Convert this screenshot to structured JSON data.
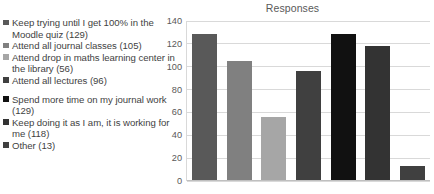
{
  "chart_data": {
    "type": "bar",
    "title": "Responses",
    "xlabel": "",
    "ylabel": "",
    "ylim": [
      0,
      140
    ],
    "ytick_step": 20,
    "yticks": [
      140,
      120,
      100,
      80,
      60,
      40,
      20,
      0
    ],
    "grid": true,
    "legend_position": "left",
    "categories": [
      "Keep trying until I get 100% in the Moodle quiz  (129)",
      "Attend all journal classes  (105)",
      "Attend drop in maths learning center in the library  (56)",
      "Attend all lectures  (96)",
      "Spend more time on my journal work  (129)",
      "Keep doing it as I am, it is working for me  (118)",
      "Other (13)"
    ],
    "values": [
      129,
      105,
      56,
      96,
      129,
      118,
      13
    ],
    "colors": [
      "#595959",
      "#808080",
      "#a6a6a6",
      "#404040",
      "#111111",
      "#333333",
      "#404040"
    ]
  },
  "legend": {
    "items": [
      {
        "label": "Keep trying until I get 100% in the Moodle quiz  (129)",
        "color": "#595959"
      },
      {
        "label": "Attend all journal classes  (105)",
        "color": "#808080"
      },
      {
        "label": "Attend drop in maths learning center in the library  (56)",
        "color": "#a6a6a6"
      },
      {
        "label": "Attend all lectures  (96)",
        "color": "#404040"
      },
      {
        "label": "Spend more time on my journal work  (129)",
        "color": "#111111"
      },
      {
        "label": "Keep doing it as I am, it is working for me  (118)",
        "color": "#333333"
      },
      {
        "label": "Other (13)",
        "color": "#404040"
      }
    ]
  }
}
